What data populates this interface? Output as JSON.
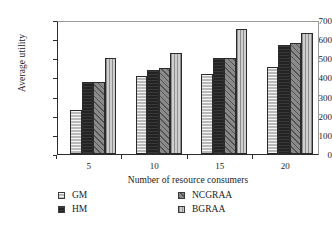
{
  "chart_data": {
    "type": "bar",
    "title": "",
    "subtitle": "",
    "xlabel": "Number of resource consumers",
    "ylabel": "Average utility",
    "categories": [
      "5",
      "10",
      "15",
      "20"
    ],
    "ylim": [
      0,
      700
    ],
    "ytick_values": [
      0,
      100,
      200,
      300,
      400,
      500,
      600,
      700
    ],
    "ytick_labels": [
      "0",
      "100",
      "200",
      "300",
      "400",
      "500",
      "600",
      "700"
    ],
    "grid": false,
    "legend_position": "below-plot",
    "series": [
      {
        "name": "GM",
        "values": [
          230,
          410,
          420,
          452
        ],
        "fill": "light-gray-horizontal-hatch",
        "color": "#b9b9b9"
      },
      {
        "name": "HM",
        "values": [
          378,
          440,
          500,
          572
        ],
        "fill": "solid-black",
        "color": "#232323"
      },
      {
        "name": "NCGRAA",
        "values": [
          378,
          450,
          503,
          582
        ],
        "fill": "dark-gray-diagonal-hatch",
        "color": "#8a8a8a"
      },
      {
        "name": "BGRAA",
        "values": [
          500,
          530,
          652,
          632
        ],
        "fill": "pale-gray-vertical-hatch",
        "color": "#cfcfcf"
      }
    ]
  },
  "legend": {
    "items": [
      {
        "label": "GM"
      },
      {
        "label": "HM"
      },
      {
        "label": "NCGRAA"
      },
      {
        "label": "BGRAA"
      }
    ]
  }
}
